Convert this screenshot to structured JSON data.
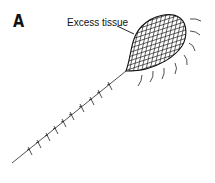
{
  "figure": {
    "panel_label": "A",
    "callout_label": "Excess tissue",
    "colors": {
      "ink": "#111111",
      "background": "#ffffff"
    },
    "elements": [
      {
        "type": "stalk-line",
        "from": [
          12,
          163
        ],
        "to": [
          126,
          71
        ]
      },
      {
        "type": "mesh-blob",
        "description": "cross-hatched teardrop of excess tissue"
      },
      {
        "type": "motion-arcs",
        "count": 8
      },
      {
        "type": "stitch-ticks",
        "count": 10
      }
    ]
  }
}
